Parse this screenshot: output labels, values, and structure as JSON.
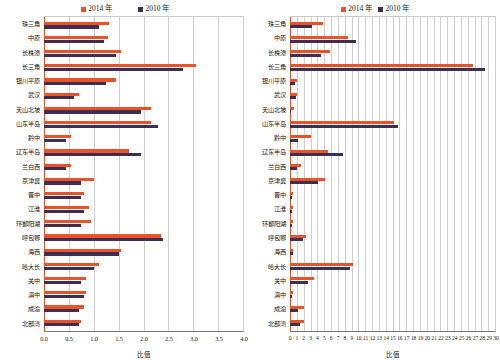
{
  "chart_data": [
    {
      "id": "left",
      "type": "bar",
      "orientation": "horizontal",
      "title": "",
      "xlabel": "比值",
      "ylabel": "",
      "xlim": [
        0,
        4.0
      ],
      "xticks": [
        "0.0",
        "0.5",
        "1.0",
        "1.5",
        "2.0",
        "2.5",
        "3.0",
        "3.5",
        "4.0"
      ],
      "grid": true,
      "legend_position": "top-center",
      "colors": {
        "2014": "#e8532a",
        "2010": "#3e2e52"
      },
      "categories": [
        "珠三角",
        "中原",
        "长株潭",
        "长三角",
        "银川平原",
        "武汉",
        "天山北坡",
        "山东半岛",
        "黔中",
        "辽东半岛",
        "兰白西",
        "京津冀",
        "晋中",
        "江淮",
        "环鄱阳湖",
        "呼包鄂",
        "海西",
        "哈大长",
        "关中",
        "滇中",
        "成渝",
        "北部湾"
      ],
      "series": [
        {
          "name": "2014 年",
          "values": [
            1.3,
            1.28,
            1.55,
            3.05,
            1.45,
            0.7,
            2.15,
            2.15,
            0.55,
            1.7,
            0.55,
            1.0,
            0.8,
            0.9,
            0.95,
            2.35,
            1.55,
            1.1,
            0.85,
            0.85,
            0.8,
            0.75
          ]
        },
        {
          "name": "2010 年",
          "values": [
            1.1,
            1.2,
            1.45,
            2.8,
            1.25,
            0.6,
            1.95,
            2.3,
            0.45,
            1.95,
            0.45,
            0.75,
            0.75,
            0.8,
            0.75,
            2.4,
            1.5,
            1.0,
            0.75,
            0.8,
            0.7,
            0.7
          ]
        }
      ]
    },
    {
      "id": "right",
      "type": "bar",
      "orientation": "horizontal",
      "title": "",
      "xlabel": "比值",
      "ylabel": "",
      "xlim": [
        0,
        30
      ],
      "xticks": [
        "0",
        "1",
        "2",
        "3",
        "4",
        "5",
        "6",
        "7",
        "8",
        "9",
        "10",
        "11",
        "12",
        "13",
        "14",
        "15",
        "16",
        "17",
        "18",
        "19",
        "20",
        "21",
        "22",
        "23",
        "24",
        "25",
        "26",
        "27",
        "28",
        "29",
        "30"
      ],
      "grid": true,
      "legend_position": "top-center",
      "colors": {
        "2014": "#e8532a",
        "2010": "#3e2e52"
      },
      "categories": [
        "珠三角",
        "中原",
        "长株潭",
        "长三角",
        "银川平原",
        "武汉",
        "天山北坡",
        "山东半岛",
        "黔中",
        "辽东半岛",
        "兰白西",
        "京津冀",
        "晋中",
        "江淮",
        "环鄱阳湖",
        "呼包鄂",
        "海西",
        "哈大长",
        "关中",
        "滇中",
        "成渝",
        "北部湾"
      ],
      "series": [
        {
          "name": "2014 年",
          "values": [
            4.8,
            8.5,
            5.9,
            26.8,
            1.0,
            1.0,
            0.6,
            15.2,
            3.0,
            5.5,
            1.6,
            5.1,
            0.4,
            0.4,
            0.4,
            2.3,
            0.5,
            9.2,
            3.5,
            0.4,
            2.0,
            2.0
          ]
        },
        {
          "name": "2010 年",
          "values": [
            3.2,
            9.6,
            4.5,
            28.5,
            0.8,
            0.9,
            0.2,
            15.8,
            1.1,
            7.8,
            1.0,
            4.1,
            0.3,
            0.3,
            0.3,
            1.9,
            0.4,
            8.8,
            2.6,
            0.3,
            1.2,
            1.5
          ]
        }
      ]
    }
  ],
  "panels": [
    {
      "name": "left-panel",
      "legend": [
        {
          "label": "2014 年",
          "color": "#e8532a",
          "name": "legend-2014"
        },
        {
          "label": "2010 年",
          "color": "#3e2e52",
          "name": "legend-2010"
        }
      ]
    },
    {
      "name": "right-panel",
      "legend": [
        {
          "label": "2014 年",
          "color": "#e8532a",
          "name": "legend-2014"
        },
        {
          "label": "2010 年",
          "color": "#3e2e52",
          "name": "legend-2010"
        }
      ]
    }
  ]
}
